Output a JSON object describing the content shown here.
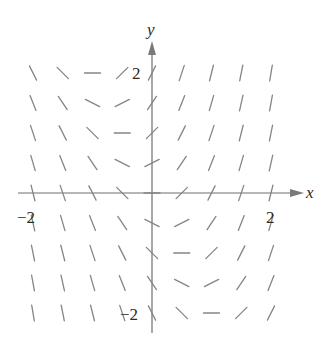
{
  "figure": {
    "type": "slope-field",
    "equation": "dy/dx = 2x + y",
    "x_axis_label": "x",
    "y_axis_label": "y",
    "tick_labels": {
      "x_neg": "−2",
      "x_pos": "2",
      "y_pos": "2",
      "y_neg": "−2"
    },
    "grid": {
      "x_values": [
        -2,
        -1.5,
        -1,
        -0.5,
        0,
        0.5,
        1,
        1.5,
        2
      ],
      "y_values": [
        2,
        1.5,
        1,
        0.5,
        0,
        -0.5,
        -1,
        -1.5,
        -2
      ]
    },
    "slopes": [
      [
        -2,
        -1,
        0,
        1,
        2,
        3,
        4,
        5,
        6
      ],
      [
        -2.5,
        -1.5,
        -0.5,
        0.5,
        1.5,
        2.5,
        3.5,
        4.5,
        5.5
      ],
      [
        -3,
        -2,
        -1,
        0,
        1,
        2,
        3,
        4,
        5
      ],
      [
        -3.5,
        -2.5,
        -1.5,
        -0.5,
        0.5,
        1.5,
        2.5,
        3.5,
        4.5
      ],
      [
        -4,
        -3,
        -2,
        -1,
        0,
        1,
        2,
        3,
        4
      ],
      [
        -4.5,
        -3.5,
        -2.5,
        -1.5,
        -0.5,
        0.5,
        1.5,
        2.5,
        3.5
      ],
      [
        -5,
        -4,
        -3,
        -2,
        -1,
        0,
        1,
        2,
        3
      ],
      [
        -5.5,
        -4.5,
        -3.5,
        -2.5,
        -1.5,
        -0.5,
        0.5,
        1.5,
        2.5
      ],
      [
        -6,
        -5,
        -4,
        -3,
        -2,
        -1,
        0,
        1,
        2
      ]
    ],
    "colors": {
      "segments": "#858585",
      "axes": "#6e6e6e",
      "labels": "#2a2a2a"
    }
  }
}
